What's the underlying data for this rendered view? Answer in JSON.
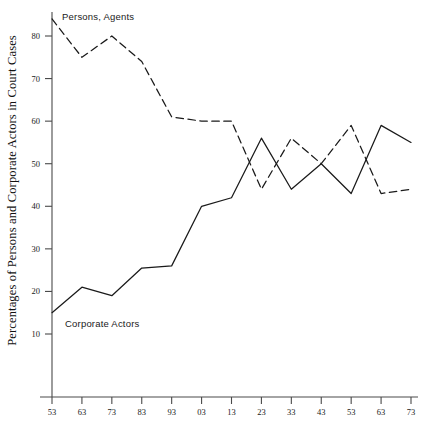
{
  "axis": {
    "ylabel": "Percentages of Persons and Corporate Actors in Court Cases",
    "y_ticks": [
      "10",
      "20",
      "30",
      "40",
      "50",
      "60",
      "70",
      "80"
    ],
    "x_ticks": [
      "53",
      "63",
      "73",
      "83",
      "93",
      "03",
      "13",
      "23",
      "33",
      "43",
      "53",
      "63",
      "73"
    ]
  },
  "labels": {
    "persons": "Persons, Agents",
    "corporate": "Corporate Actors"
  },
  "colors": {
    "axis": "#4a4a4a",
    "line": "#1a1a1a",
    "background": "#ffffff"
  },
  "chart_data": {
    "type": "line",
    "title": "",
    "xlabel": "",
    "ylabel": "Percentages of Persons and Corporate Actors in Court Cases",
    "xlim": [
      1853,
      1973
    ],
    "ylim": [
      0,
      85
    ],
    "grid": false,
    "legend": "inline-annotations",
    "x": [
      1853,
      1863,
      1873,
      1883,
      1893,
      1903,
      1913,
      1923,
      1933,
      1943,
      1953,
      1963,
      1973
    ],
    "x_tick_labels": [
      "53",
      "63",
      "73",
      "83",
      "93",
      "03",
      "13",
      "23",
      "33",
      "43",
      "53",
      "63",
      "73"
    ],
    "y_ticks": [
      10,
      20,
      30,
      40,
      50,
      60,
      70,
      80
    ],
    "series": [
      {
        "name": "Persons, Agents",
        "style": "dashed",
        "values": [
          84,
          75,
          80,
          74,
          61,
          60,
          60,
          44,
          56,
          50,
          59,
          43,
          44
        ]
      },
      {
        "name": "Corporate Actors",
        "style": "solid",
        "values": [
          15,
          21,
          19,
          25.5,
          26,
          40,
          42,
          56,
          44,
          50,
          43,
          59,
          55
        ]
      }
    ]
  },
  "geometry": {
    "plot_left": 52,
    "plot_right": 411,
    "plot_bottom": 397,
    "y_pixel_at_10": 334,
    "y_pixel_at_80": 36
  }
}
